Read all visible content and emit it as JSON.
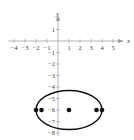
{
  "chart_data": {
    "type": "scatter",
    "title": "",
    "xlabel": "x",
    "ylabel": "y",
    "xlim": [
      -4.5,
      6.5
    ],
    "ylim": [
      -8.5,
      3
    ],
    "grid": false,
    "x_ticks": [
      -4,
      -3,
      -2,
      -1,
      1,
      2,
      3,
      4,
      5
    ],
    "x_tick_labels": [
      "−4",
      "−3",
      "−2",
      "−1",
      "1",
      "2",
      "3",
      "4",
      "5"
    ],
    "y_ticks": [
      2,
      1,
      -1,
      -2,
      -3,
      -4,
      -5,
      -6,
      -7,
      -8
    ],
    "y_tick_labels": [
      "",
      "1",
      "−1",
      "−2",
      "−3",
      "−4",
      "−5",
      "−6",
      "−7",
      "−8"
    ],
    "ellipse": {
      "center": [
        1,
        -6
      ],
      "semi_major_x": 3,
      "semi_minor_y": 1.7
    },
    "points": [
      {
        "x": -2,
        "y": -6,
        "label": "vertex"
      },
      {
        "x": -1.5,
        "y": -6,
        "label": "focus"
      },
      {
        "x": 1,
        "y": -6,
        "label": "center"
      },
      {
        "x": 3.5,
        "y": -6,
        "label": "focus"
      },
      {
        "x": 4,
        "y": -6,
        "label": "vertex"
      }
    ]
  },
  "labels": {
    "x_axis": "x",
    "y_axis": "y"
  },
  "colors": {
    "axis": "#9a9a9a",
    "curve": "#111111",
    "points": "#111111",
    "text": "#444444"
  }
}
